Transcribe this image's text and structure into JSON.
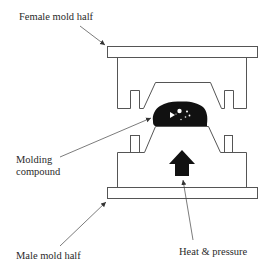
{
  "diagram": {
    "type": "compression-molding-schematic",
    "labels": {
      "female_mold": "Female mold half",
      "molding_compound_line1": "Molding",
      "molding_compound_line2": "compound",
      "male_mold": "Male mold half",
      "heat_pressure": "Heat & pressure"
    },
    "colors": {
      "line": "#555555",
      "fill_dark": "#111111",
      "background": "#ffffff",
      "text": "#2a2a2a"
    }
  }
}
